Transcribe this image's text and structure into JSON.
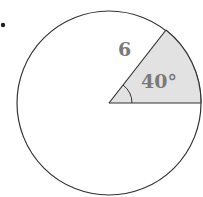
{
  "diagram": {
    "type": "circle-sector",
    "radius_label": "6",
    "angle_label": "40°",
    "radius_value": 6,
    "central_angle_degrees": 40,
    "colors": {
      "stroke": "#333333",
      "sector_fill": "#e2e2e2",
      "label": "#7a7a7a",
      "bullet": "#222222"
    }
  }
}
